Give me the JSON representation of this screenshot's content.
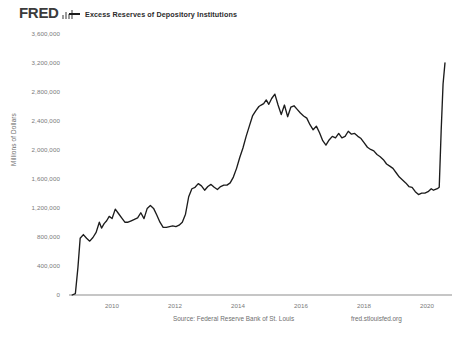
{
  "header": {
    "logo_text": "FRED",
    "logo_glyph": "bar-chart-glyph",
    "legend_label": "Excess Reserves of Depository Institutions",
    "legend_color": "#1c1c1c"
  },
  "footer": {
    "source": "Source: Federal Reserve Bank of St. Louis",
    "url": "fred.stlouisfed.org"
  },
  "chart_data": {
    "type": "line",
    "title": "",
    "subtitle": "",
    "xlabel": "",
    "ylabel": "Millions of Dollars",
    "legend": [
      "Excess Reserves of Depository Institutions"
    ],
    "legend_position": "top",
    "grid": false,
    "line_color": "#1c1c1c",
    "xlim": [
      2008.6,
      2020.6
    ],
    "ylim": [
      0,
      3600000
    ],
    "xtick_labels": [
      "2010",
      "2012",
      "2014",
      "2016",
      "2018",
      "2020"
    ],
    "xticks": [
      2010,
      2012,
      2014,
      2016,
      2018,
      2020
    ],
    "ytick_labels": [
      "0",
      "400,000",
      "800,000",
      "1,200,000",
      "1,600,000",
      "2,000,000",
      "2,400,000",
      "2,800,000",
      "3,200,000",
      "3,600,000"
    ],
    "yticks": [
      0,
      400000,
      800000,
      1200000,
      1600000,
      2000000,
      2400000,
      2800000,
      3200000,
      3600000
    ],
    "series": [
      {
        "name": "Excess Reserves of Depository Institutions",
        "x": [
          2008.7,
          2008.8,
          2008.88,
          2008.95,
          2009.05,
          2009.15,
          2009.25,
          2009.35,
          2009.45,
          2009.55,
          2009.62,
          2009.7,
          2009.78,
          2009.86,
          2009.95,
          2010.05,
          2010.15,
          2010.25,
          2010.35,
          2010.45,
          2010.55,
          2010.65,
          2010.75,
          2010.85,
          2010.95,
          2011.05,
          2011.15,
          2011.25,
          2011.35,
          2011.45,
          2011.55,
          2011.65,
          2011.75,
          2011.85,
          2011.95,
          2012.05,
          2012.15,
          2012.25,
          2012.35,
          2012.45,
          2012.55,
          2012.65,
          2012.75,
          2012.85,
          2012.95,
          2013.05,
          2013.15,
          2013.25,
          2013.35,
          2013.45,
          2013.55,
          2013.65,
          2013.75,
          2013.85,
          2013.95,
          2014.05,
          2014.15,
          2014.25,
          2014.35,
          2014.45,
          2014.55,
          2014.62,
          2014.7,
          2014.78,
          2014.86,
          2014.95,
          2015.05,
          2015.15,
          2015.25,
          2015.35,
          2015.45,
          2015.55,
          2015.65,
          2015.75,
          2015.85,
          2015.95,
          2016.05,
          2016.15,
          2016.25,
          2016.35,
          2016.45,
          2016.55,
          2016.65,
          2016.75,
          2016.85,
          2016.95,
          2017.05,
          2017.15,
          2017.25,
          2017.35,
          2017.45,
          2017.55,
          2017.65,
          2017.75,
          2017.85,
          2017.95,
          2018.05,
          2018.15,
          2018.25,
          2018.35,
          2018.45,
          2018.55,
          2018.65,
          2018.75,
          2018.85,
          2018.95,
          2019.05,
          2019.15,
          2019.25,
          2019.35,
          2019.45,
          2019.55,
          2019.65,
          2019.75,
          2019.85,
          2019.95,
          2020.02,
          2020.08,
          2020.14,
          2020.2,
          2020.26,
          2020.32,
          2020.38
        ],
        "y": [
          0,
          20000,
          380000,
          780000,
          830000,
          780000,
          740000,
          790000,
          860000,
          1000000,
          920000,
          980000,
          1020000,
          1080000,
          1050000,
          1180000,
          1120000,
          1060000,
          1000000,
          1000000,
          1020000,
          1040000,
          1060000,
          1130000,
          1050000,
          1190000,
          1230000,
          1190000,
          1100000,
          1000000,
          930000,
          930000,
          940000,
          950000,
          940000,
          960000,
          1000000,
          1110000,
          1350000,
          1460000,
          1480000,
          1530000,
          1500000,
          1440000,
          1490000,
          1520000,
          1480000,
          1450000,
          1490000,
          1510000,
          1510000,
          1540000,
          1620000,
          1740000,
          1890000,
          2020000,
          2180000,
          2320000,
          2460000,
          2530000,
          2590000,
          2610000,
          2630000,
          2680000,
          2620000,
          2700000,
          2760000,
          2610000,
          2480000,
          2610000,
          2450000,
          2580000,
          2600000,
          2550000,
          2500000,
          2460000,
          2430000,
          2340000,
          2270000,
          2320000,
          2230000,
          2120000,
          2060000,
          2130000,
          2180000,
          2160000,
          2220000,
          2160000,
          2180000,
          2250000,
          2210000,
          2220000,
          2180000,
          2150000,
          2090000,
          2030000,
          2000000,
          1980000,
          1930000,
          1900000,
          1860000,
          1800000,
          1770000,
          1740000,
          1680000,
          1620000,
          1580000,
          1540000,
          1490000,
          1480000,
          1420000,
          1380000,
          1400000,
          1400000,
          1420000,
          1460000,
          1440000,
          1450000,
          1460000,
          1480000,
          2250000,
          2900000,
          3190000
        ]
      }
    ]
  }
}
